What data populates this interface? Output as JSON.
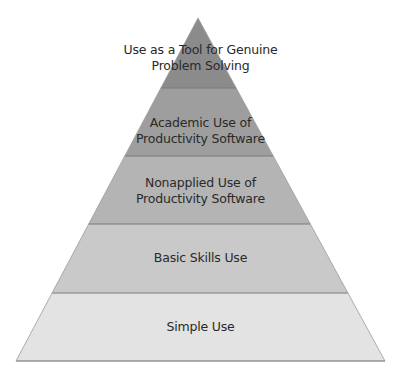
{
  "diagram": {
    "type": "pyramid",
    "apex": [
      198,
      18
    ],
    "base": {
      "left": 16,
      "right": 385,
      "y": 361
    },
    "tiers": [
      {
        "level": 5,
        "lines": [
          "Use as a Tool for Genuine",
          "Problem Solving"
        ],
        "color": "#8b8b8b",
        "y_top": 18,
        "y_bottom": 88
      },
      {
        "level": 4,
        "lines": [
          "Academic Use of",
          "Productivity Software"
        ],
        "color": "#9e9e9e",
        "y_top": 88,
        "y_bottom": 156
      },
      {
        "level": 3,
        "lines": [
          "Nonapplied Use of",
          "Productivity Software"
        ],
        "color": "#b4b4b4",
        "y_top": 156,
        "y_bottom": 224
      },
      {
        "level": 2,
        "lines": [
          "Basic Skills Use"
        ],
        "color": "#c9c9c9",
        "y_top": 224,
        "y_bottom": 293
      },
      {
        "level": 1,
        "lines": [
          "Simple Use"
        ],
        "color": "#e3e3e3",
        "y_top": 293,
        "y_bottom": 361
      }
    ],
    "divider_color": "#7a7a7a",
    "text_color": "#2a2a2a"
  }
}
